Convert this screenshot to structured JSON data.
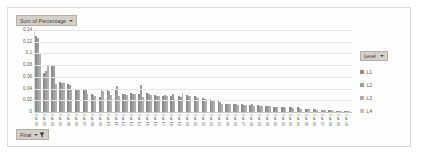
{
  "title_button": {
    "label": "Sum of Percentage",
    "icon": "chevron-down-icon"
  },
  "filter_button": {
    "label": "Final",
    "icon": "funnel-filter-icon",
    "caret": "chevron-down-icon"
  },
  "legend": {
    "header_label": "Level",
    "header_icon": "chevron-down-icon",
    "items": [
      {
        "label": "L1",
        "color": "#8c8c8c"
      },
      {
        "label": "L2",
        "color": "#9e9e9e"
      },
      {
        "label": "L3",
        "color": "#b0b0b0"
      },
      {
        "label": "L4",
        "color": "#c4c4c4"
      }
    ]
  },
  "chart_data": {
    "type": "bar",
    "title": "Sum of Percentage",
    "xlabel": "",
    "ylabel": "",
    "ylim": [
      0,
      0.14
    ],
    "grid": true,
    "legend_position": "right",
    "ytick_labels": [
      "0.14",
      "0.12",
      "0.1",
      "0.08",
      "0.06",
      "0.04",
      "0.02",
      "0"
    ],
    "ytick_values": [
      0.14,
      0.12,
      0.1,
      0.08,
      0.06,
      0.04,
      0.02,
      0
    ],
    "categories": [
      "Cat 01",
      "Cat 02",
      "Cat 03",
      "Cat 04",
      "Cat 05",
      "Cat 06",
      "Cat 07",
      "Cat 08",
      "Cat 09",
      "Cat 10",
      "Cat 11",
      "Cat 12",
      "Cat 13",
      "Cat 14",
      "Cat 15",
      "Cat 16",
      "Cat 17",
      "Cat 18",
      "Cat 19",
      "Cat 20",
      "Cat 21",
      "Cat 22",
      "Cat 23",
      "Cat 24",
      "Cat 25",
      "Cat 26",
      "Cat 27",
      "Cat 28",
      "Cat 29",
      "Cat 30",
      "Cat 31",
      "Cat 32",
      "Cat 33",
      "Cat 34",
      "Cat 35",
      "Cat 36",
      "Cat 37",
      "Cat 38",
      "Cat 39",
      "Cat 40"
    ],
    "series": [
      {
        "name": "L1",
        "color": "#8c8c8c",
        "values": [
          0.13,
          0.067,
          0.08,
          0.052,
          0.048,
          0.037,
          0.04,
          0.031,
          0.026,
          0.037,
          0.038,
          0.03,
          0.033,
          0.03,
          0.033,
          0.029,
          0.028,
          0.028,
          0.027,
          0.029,
          0.027,
          0.024,
          0.022,
          0.018,
          0.013,
          0.013,
          0.013,
          0.012,
          0.012,
          0.011,
          0.009,
          0.009,
          0.008,
          0.008,
          0.006,
          0.006,
          0.004,
          0.003,
          0.002,
          0.002
        ]
      },
      {
        "name": "L2",
        "color": "#9e9e9e",
        "values": [
          0.126,
          0.07,
          0.08,
          0.05,
          0.046,
          0.039,
          0.038,
          0.029,
          0.037,
          0.036,
          0.044,
          0.03,
          0.031,
          0.046,
          0.03,
          0.028,
          0.029,
          0.03,
          0.026,
          0.028,
          0.026,
          0.023,
          0.021,
          0.017,
          0.014,
          0.014,
          0.012,
          0.013,
          0.011,
          0.011,
          0.008,
          0.008,
          0.008,
          0.007,
          0.006,
          0.005,
          0.004,
          0.003,
          0.002,
          0.001
        ]
      },
      {
        "name": "L3",
        "color": "#b0b0b0",
        "values": [
          0.101,
          0.078,
          0.047,
          0.049,
          0.037,
          0.038,
          0.03,
          0.028,
          0.036,
          0.029,
          0.027,
          0.029,
          0.03,
          0.025,
          0.029,
          0.027,
          0.028,
          0.022,
          0.032,
          0.027,
          0.024,
          0.022,
          0.019,
          0.014,
          0.013,
          0.012,
          0.012,
          0.011,
          0.011,
          0.01,
          0.008,
          0.007,
          0.007,
          0.006,
          0.005,
          0.004,
          0.003,
          0.002,
          0.002,
          0.001
        ]
      },
      {
        "name": "L4",
        "color": "#c4c4c4",
        "values": [
          0.0,
          0.0,
          0.0,
          0.0,
          0.0,
          0.0,
          0.0,
          0.0,
          0.0,
          0.0,
          0.0,
          0.0,
          0.0,
          0.0,
          0.0,
          0.0,
          0.0,
          0.0,
          0.0,
          0.0,
          0.0,
          0.0,
          0.0,
          0.0,
          0.0,
          0.0,
          0.0,
          0.0,
          0.0,
          0.0,
          0.0,
          0.0,
          0.0,
          0.0,
          0.0,
          0.0,
          0.0,
          0.0,
          0.0,
          0.0
        ]
      }
    ]
  }
}
